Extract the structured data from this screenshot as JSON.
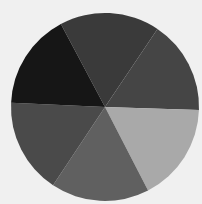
{
  "chart_data": {
    "type": "pie",
    "title": "",
    "categories": [
      "Slice 1",
      "Slice 2",
      "Slice 3",
      "Slice 4",
      "Slice 5",
      "Slice 6"
    ],
    "values": [
      17.2,
      16.1,
      16.9,
      16.9,
      16.4,
      16.5
    ],
    "colors": [
      "#3a3a3a",
      "#454545",
      "#a9a9a9",
      "#606060",
      "#4a4a4a",
      "#161616"
    ],
    "start_angle_deg": -28,
    "direction": "clockwise",
    "labels_shown": false,
    "legend": "none",
    "center": [
      105,
      107
    ],
    "radius": 94
  },
  "colors": {
    "background": "#f0f0f0"
  }
}
